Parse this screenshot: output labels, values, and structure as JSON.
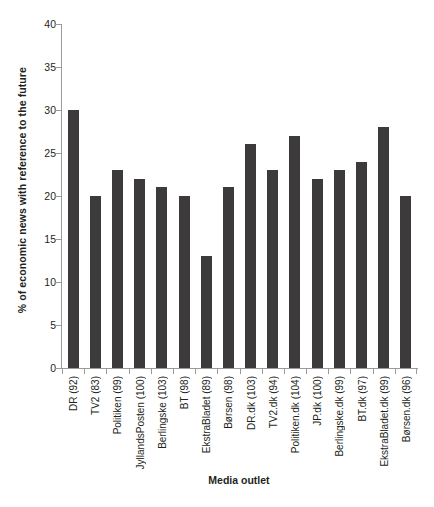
{
  "chart_data": {
    "type": "bar",
    "title": "",
    "xlabel": "Media outlet",
    "ylabel": "% of economic news with reference to the future",
    "ylim": [
      0,
      40
    ],
    "yticks": [
      0,
      5,
      10,
      15,
      20,
      25,
      30,
      35,
      40
    ],
    "grid": false,
    "legend": null,
    "bar_color": "#3d3a3b",
    "categories": [
      "DR (92)",
      "TV2 (83)",
      "Politiken (99)",
      "JyllandsPosten (100)",
      "Berlingske (103)",
      "BT (98)",
      "EkstraBladet (89)",
      "Børsen (98)",
      "DR.dk (103)",
      "TV2.dk (94)",
      "Politiken.dk (104)",
      "JP.dk (100)",
      "Berlingske.dk (99)",
      "BT.dk (97)",
      "EkstraBladet.dk (99)",
      "Børsen.dk (96)"
    ],
    "values": [
      30,
      20,
      23,
      22,
      21,
      20,
      13,
      21,
      26,
      23,
      27,
      22,
      23,
      24,
      28,
      20
    ]
  }
}
